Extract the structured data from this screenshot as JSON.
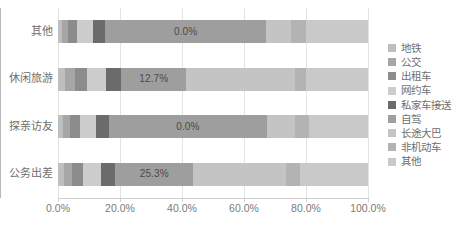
{
  "chart_data": {
    "type": "bar",
    "subtype": "stacked-horizontal-100",
    "title": "",
    "xlabel": "",
    "ylabel": "",
    "xlim": [
      0,
      100
    ],
    "grid": true,
    "legend_position": "right",
    "x_ticks": [
      "0.0%",
      "20.0%",
      "40.0%",
      "60.0%",
      "80.0%",
      "100.0%"
    ],
    "x_tick_values": [
      0,
      20,
      40,
      60,
      80,
      100
    ],
    "categories": [
      "其他",
      "休闲旅游",
      "探亲访友",
      "公务出差"
    ],
    "series": [
      {
        "name": "地铁",
        "color": "#bfbfbf",
        "values": [
          1.2,
          2.4,
          1.6,
          2.0
        ]
      },
      {
        "name": "公交",
        "color": "#a6a6a6",
        "values": [
          2.0,
          3.0,
          2.2,
          2.6
        ]
      },
      {
        "name": "出租车",
        "color": "#8c8c8c",
        "values": [
          3.0,
          4.0,
          3.2,
          3.6
        ]
      },
      {
        "name": "网约车",
        "color": "#cccccc",
        "values": [
          5.0,
          6.0,
          5.2,
          5.6
        ]
      },
      {
        "name": "私家车接送",
        "color": "#6b6b6b",
        "values": [
          4.0,
          5.0,
          4.2,
          4.6
        ]
      },
      {
        "name": "自驾",
        "color": "#9e9e9e",
        "values": [
          52.0,
          21.0,
          51.0,
          25.3
        ]
      },
      {
        "name": "长途大巴",
        "color": "#c4c4c4",
        "values": [
          8.0,
          35.0,
          9.0,
          30.0
        ]
      },
      {
        "name": "非机动车",
        "color": "#b3b3b3",
        "values": [
          4.8,
          3.6,
          4.6,
          4.3
        ]
      },
      {
        "name": "其他",
        "color": "#c9c9c9",
        "values": [
          20.0,
          20.0,
          19.0,
          22.0
        ]
      }
    ],
    "data_labels": [
      {
        "category": "其他",
        "series": "自驾",
        "text": "0.0%"
      },
      {
        "category": "休闲旅游",
        "series": "自驾",
        "text": "12.7%"
      },
      {
        "category": "探亲访友",
        "series": "自驾",
        "text": "0.0%"
      },
      {
        "category": "公务出差",
        "series": "自驾",
        "text": "25.3%"
      }
    ]
  },
  "legend": {
    "items": [
      {
        "label": "地铁"
      },
      {
        "label": "公交"
      },
      {
        "label": "出租车"
      },
      {
        "label": "网约车"
      },
      {
        "label": "私家车接送"
      },
      {
        "label": "自驾"
      },
      {
        "label": "长途大巴"
      },
      {
        "label": "非机动车"
      },
      {
        "label": "其他"
      }
    ]
  },
  "colors": {
    "background": "#ffffff",
    "gridline": "#e4e4e4",
    "axis": "#b8b8b8",
    "tick_text": "#7a7a7a",
    "category_text": "#6e6e6e",
    "data_label_text": "#4a4a4a"
  }
}
